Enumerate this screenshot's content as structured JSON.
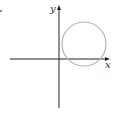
{
  "diagram": {
    "type": "coordinate-plane-with-circle",
    "x_axis_label": "x",
    "y_axis_label": "y",
    "colors": {
      "axes": "#222222",
      "circle": "#b3b3b3",
      "dot": "#555555"
    },
    "axes": {
      "origin": [
        59,
        59
      ],
      "x_from": 10,
      "x_to": 108,
      "y_from": 6,
      "y_to": 108
    },
    "circle": {
      "cx": 84,
      "cy": 44,
      "r": 22
    },
    "marker": {
      "x": 1,
      "y": 11
    }
  }
}
